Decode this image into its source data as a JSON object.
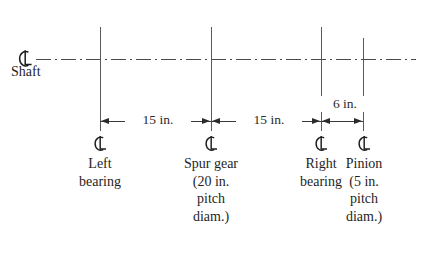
{
  "diagram": {
    "centerline_symbol": "centerline-glyph",
    "colors": {
      "line": "#5a5a5a",
      "centerline": "#4a4a4a",
      "dimension": "#2b2b2b",
      "text": "#1e1e1e",
      "background": "#ffffff"
    },
    "shaft": {
      "label": "Shaft",
      "symbol_name": "centerline-glyph"
    },
    "dimensions": [
      {
        "label": "15 in.",
        "value": 15,
        "unit": "in.",
        "from": "Left bearing",
        "to": "Spur gear"
      },
      {
        "label": "15 in.",
        "value": 15,
        "unit": "in.",
        "from": "Spur gear",
        "to": "Right bearing"
      },
      {
        "label": "6 in.",
        "value": 6,
        "unit": "in.",
        "from": "Right bearing",
        "to": "Pinion"
      }
    ],
    "stations": [
      {
        "name": "left-bearing",
        "symbol_name": "centerline-glyph",
        "lines": [
          "Left",
          "bearing"
        ]
      },
      {
        "name": "spur-gear",
        "symbol_name": "centerline-glyph",
        "lines": [
          "Spur gear",
          "(20 in.",
          "pitch",
          "diam.)"
        ]
      },
      {
        "name": "right-bearing",
        "symbol_name": "centerline-glyph",
        "lines": [
          "Right",
          "bearing"
        ]
      },
      {
        "name": "pinion",
        "symbol_name": "centerline-glyph",
        "lines": [
          "Pinion",
          "(5 in.",
          "pitch",
          "diam.)"
        ]
      }
    ]
  }
}
